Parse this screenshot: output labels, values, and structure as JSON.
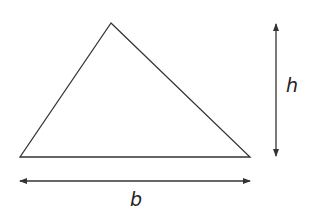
{
  "diagram": {
    "stroke_color": "#333333",
    "background": "#ffffff",
    "triangle": {
      "apex": [
        111,
        23
      ],
      "base_left": [
        20,
        157
      ],
      "base_right": [
        250,
        157
      ]
    },
    "height_arrow": {
      "x": 276,
      "y1": 24,
      "y2": 156
    },
    "base_arrow": {
      "y": 181,
      "x1": 20,
      "x2": 250
    },
    "labels": {
      "height": "h",
      "base": "b"
    }
  }
}
